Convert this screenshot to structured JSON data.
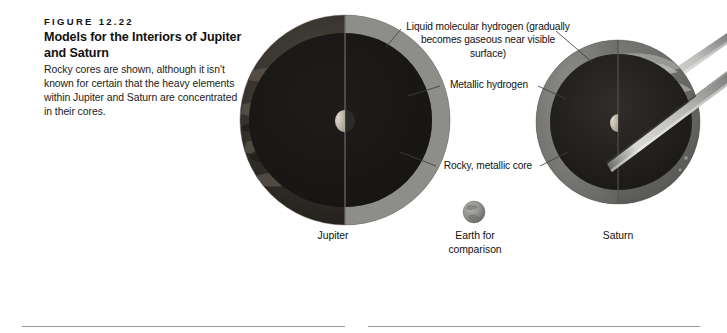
{
  "figure": {
    "number": "FIGURE 12.22",
    "title": "Models for the Interiors of Jupiter and Saturn",
    "caption": "Rocky cores are shown, although it isn't known for certain that the heavy elements within Jupiter and Saturn are concentrated in their cores."
  },
  "annotations": {
    "liquid_hydrogen": "Liquid molecular hydrogen (gradually becomes gaseous near visible surface)",
    "metallic_hydrogen": "Metallic hydrogen",
    "rocky_core": "Rocky, metallic core"
  },
  "planets": {
    "jupiter": "Jupiter",
    "earth": "Earth for comparison",
    "saturn": "Saturn"
  },
  "colors": {
    "page_background": "#ffffff",
    "jupiter_cloud_dark": "#2a2622",
    "jupiter_cloud_mid": "#4a4742",
    "jupiter_cloud_light": "#9b978c",
    "jupiter_shell_mantle": "#8c8c8c",
    "jupiter_interior_dark": "#191715",
    "core_light": "#cfcabd",
    "saturn_body": "#6f6f6f",
    "saturn_cloud_light": "#9d9d9a",
    "saturn_interior_dark": "#2a2724",
    "ring_light": "#d8d8d6",
    "ring_dark": "#4d4d4d",
    "earth_sphere": "#8e8e8c",
    "leader_line": "#4a4a4a",
    "column_rule": "#9a9a9a"
  }
}
